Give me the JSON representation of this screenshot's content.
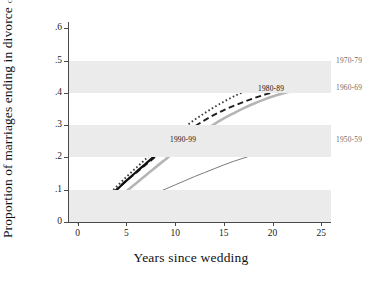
{
  "chart_data": {
    "type": "line",
    "title": "",
    "ylabel": "Proportion of marriages ending in divorce",
    "ylabel_sub": "Conditional on being married but not widowed",
    "xlabel": "Years since wedding",
    "xlim": [
      -1,
      26
    ],
    "ylim": [
      0,
      0.62
    ],
    "xticks": [
      "0",
      "5",
      "10",
      "15",
      "20",
      "25"
    ],
    "xtick_values": [
      0,
      5,
      10,
      15,
      20,
      25
    ],
    "yticks": [
      "0",
      ".1",
      ".2",
      ".3",
      ".4",
      ".5",
      ".6"
    ],
    "ytick_values": [
      0,
      0.1,
      0.2,
      0.3,
      0.4,
      0.5,
      0.6
    ],
    "grid": false,
    "bands": [
      {
        "from": 0.0,
        "to": 0.1,
        "color": "#ebebeb"
      },
      {
        "from": 0.2,
        "to": 0.3,
        "color": "#ebebeb"
      },
      {
        "from": 0.4,
        "to": 0.5,
        "color": "#ebebeb"
      }
    ],
    "legend_position": "inline-right",
    "series": [
      {
        "name": "1970-79",
        "style": "dotted",
        "color": "#3d3d3d",
        "label_position": "right-outside",
        "x": [
          0,
          1,
          2,
          3,
          4,
          5,
          6,
          7,
          8,
          9,
          10,
          11,
          12,
          13,
          14,
          15,
          16,
          17,
          18,
          19,
          20,
          21,
          22,
          23,
          24,
          25
        ],
        "values": [
          0.0,
          0.022,
          0.049,
          0.08,
          0.11,
          0.14,
          0.168,
          0.196,
          0.222,
          0.248,
          0.272,
          0.295,
          0.317,
          0.337,
          0.356,
          0.373,
          0.389,
          0.403,
          0.416,
          0.428,
          0.44,
          0.451,
          0.461,
          0.47,
          0.479,
          0.488
        ]
      },
      {
        "name": "1980-89",
        "style": "dashed",
        "color": "#1f1f1f",
        "label_position": "inline",
        "x": [
          0,
          1,
          2,
          3,
          4,
          5,
          6,
          7,
          8,
          9,
          10,
          11,
          12,
          13,
          14,
          15,
          16,
          17,
          18,
          19,
          20
        ],
        "values": [
          0.0,
          0.02,
          0.045,
          0.073,
          0.101,
          0.128,
          0.153,
          0.178,
          0.203,
          0.228,
          0.252,
          0.275,
          0.296,
          0.315,
          0.332,
          0.347,
          0.36,
          0.372,
          0.383,
          0.393,
          0.402
        ]
      },
      {
        "name": "1990-99",
        "style": "solid-thick",
        "color": "#111111",
        "label_position": "inline",
        "x": [
          0,
          1,
          2,
          3,
          4,
          5,
          6,
          7,
          8,
          9
        ],
        "values": [
          0.0,
          0.019,
          0.044,
          0.072,
          0.1,
          0.128,
          0.155,
          0.181,
          0.207,
          0.232
        ]
      },
      {
        "name": "1960-69",
        "style": "solid-gray-thick",
        "color": "#b5b5b5",
        "label_position": "right-outside",
        "x": [
          0,
          1,
          2,
          3,
          4,
          5,
          6,
          7,
          8,
          9,
          10,
          11,
          12,
          13,
          14,
          15,
          16,
          17,
          18,
          19,
          20,
          21,
          22,
          23,
          24,
          25
        ],
        "values": [
          0.0,
          0.012,
          0.029,
          0.049,
          0.072,
          0.096,
          0.12,
          0.145,
          0.17,
          0.194,
          0.218,
          0.241,
          0.263,
          0.284,
          0.303,
          0.321,
          0.337,
          0.352,
          0.366,
          0.378,
          0.389,
          0.398,
          0.406,
          0.413,
          0.419,
          0.424
        ]
      },
      {
        "name": "1950-59",
        "style": "solid-thin",
        "color": "#6b6b6b",
        "label_position": "right-outside",
        "x": [
          0,
          1,
          2,
          3,
          4,
          5,
          6,
          7,
          8,
          9,
          10,
          11,
          12,
          13,
          14,
          15,
          16,
          17,
          18,
          19,
          20,
          21,
          22,
          23,
          24,
          25
        ],
        "values": [
          0.0,
          0.007,
          0.016,
          0.027,
          0.038,
          0.05,
          0.063,
          0.076,
          0.089,
          0.102,
          0.115,
          0.128,
          0.141,
          0.153,
          0.165,
          0.177,
          0.188,
          0.198,
          0.208,
          0.217,
          0.225,
          0.233,
          0.24,
          0.246,
          0.251,
          0.256
        ]
      }
    ],
    "annotations": [
      {
        "text": "1970-79",
        "x_px": 336,
        "y_px": 57,
        "style": "outside"
      },
      {
        "text": "1960-69",
        "x_px": 336,
        "y_px": 84,
        "style": "outside"
      },
      {
        "text": "1950-59",
        "x_px": 336,
        "y_px": 136,
        "style": "outside"
      },
      {
        "text": "1980-89",
        "x_px": 258,
        "y_px": 85,
        "style": "inside"
      },
      {
        "text": "1990-99",
        "x_px": 170,
        "y_px": 136,
        "style": "inside"
      }
    ]
  }
}
